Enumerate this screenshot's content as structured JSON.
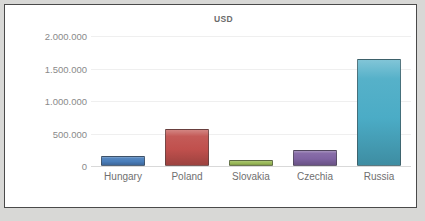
{
  "chart_data": {
    "type": "bar",
    "title": "USD",
    "xlabel": "",
    "ylabel": "",
    "categories": [
      "Hungary",
      "Poland",
      "Slovakia",
      "Czechia",
      "Russia"
    ],
    "values": [
      150000,
      575000,
      90000,
      240000,
      1650000
    ],
    "series": [
      {
        "name": "USD",
        "values": [
          150000,
          575000,
          90000,
          240000,
          1650000
        ]
      }
    ],
    "ylim": [
      0,
      2000000
    ],
    "ytick_values": [
      2000000,
      1500000,
      1000000,
      500000,
      0
    ],
    "ytick_labels": [
      "2.000.000",
      "1.500.000",
      "1.000.000",
      "500.000",
      "0"
    ],
    "grid": true,
    "legend": false,
    "bar_colors": [
      "#4a7ebb",
      "#c0504d",
      "#9bbb59",
      "#8064a2",
      "#4bacc6"
    ],
    "colors": {
      "hungary": "#4a7ebb",
      "poland": "#c0504d",
      "slovakia": "#9bbb59",
      "czechia": "#8064a2",
      "russia": "#4bacc6",
      "plot_background": "#ffffff",
      "page_background": "#d8d8d6",
      "frame_border": "#4a4a4a",
      "gridline": "#efefef",
      "tick_label": "#8a8a8a",
      "title": "#6b6b6b"
    }
  }
}
